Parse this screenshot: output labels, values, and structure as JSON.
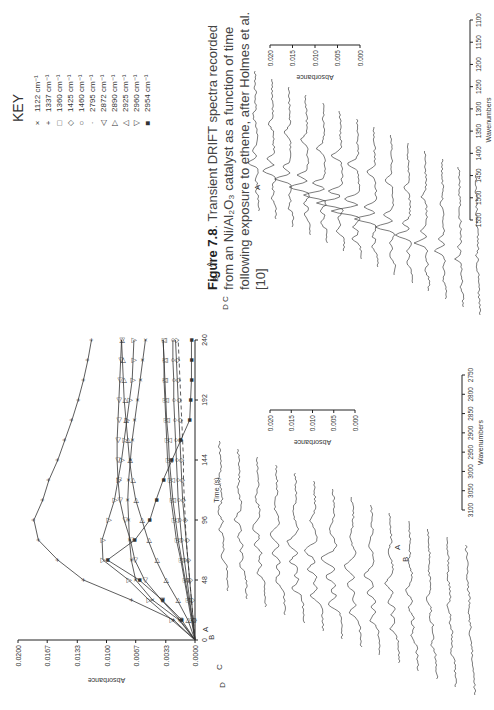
{
  "caption": {
    "figure_label": "Figure 7.8",
    "text": ". Transient DRIFT spectra recorded from an Ni/Al₂O₃ catalyst as a function of time following exposure to ethene, after Holmes et al. [10]"
  },
  "key": {
    "title": "KEY",
    "items": [
      {
        "symbol": "×",
        "label": "1122 cm⁻¹"
      },
      {
        "symbol": "+",
        "label": "1337 cm⁻¹"
      },
      {
        "symbol": "□",
        "label": "1360 cm⁻¹"
      },
      {
        "symbol": "◇",
        "label": "1425 cm⁻¹"
      },
      {
        "symbol": "○",
        "label": "1460 cm⁻¹"
      },
      {
        "symbol": "·",
        "label": "2795 cm⁻¹"
      },
      {
        "symbol": "◁",
        "label": "2872 cm⁻¹"
      },
      {
        "symbol": "▷",
        "label": "2890 cm⁻¹"
      },
      {
        "symbol": "△",
        "label": "2925 cm⁻¹"
      },
      {
        "symbol": "▽",
        "label": "2960 cm⁻¹"
      },
      {
        "symbol": "■",
        "label": "2954 cm⁻¹"
      }
    ]
  },
  "chart_data": [
    {
      "type": "line",
      "title": "",
      "xlabel": "Time (s)",
      "ylabel": "Absorbance",
      "x": [
        0,
        16,
        32,
        48,
        64,
        80,
        96,
        112,
        128,
        144,
        160,
        176,
        192,
        208,
        224,
        240
      ],
      "xticks": [
        0,
        48,
        96,
        144,
        192,
        240
      ],
      "yticks": [
        0.0,
        0.0033,
        0.0067,
        0.01,
        0.0133,
        0.0167,
        0.02
      ],
      "ytick_labels": [
        "0.0000",
        "0.0033",
        "0.0067",
        "0.0100",
        "0.0133",
        "0.0167",
        "0.0200"
      ],
      "ylim": [
        0,
        0.02
      ],
      "xlim": [
        0,
        240
      ],
      "series": [
        {
          "name": "1337 cm-1",
          "marker": "+",
          "values": [
            0,
            0.0024,
            0.0072,
            0.0126,
            0.0155,
            0.0177,
            0.0182,
            0.0172,
            0.0165,
            0.0155,
            0.0147,
            0.0139,
            0.0132,
            0.0126,
            0.0121,
            0.0117
          ]
        },
        {
          "name": "2960 cm-1",
          "marker": "▽",
          "values": [
            0,
            0.0026,
            0.0052,
            0.0075,
            0.0104,
            0.0105,
            0.0098,
            0.0091,
            0.0087,
            0.0083,
            0.008,
            0.0077,
            0.0074,
            0.0071,
            0.007,
            0.0069
          ]
        },
        {
          "name": "2954 cm-1",
          "marker": "■",
          "values": [
            0,
            0.0015,
            0.0037,
            0.0063,
            0.0099,
            0.0068,
            0.0051,
            0.0044,
            0.0036,
            0.0026,
            0.0016,
            0.0006,
            0.0005,
            0.0004,
            0.0004,
            0.0004
          ]
        },
        {
          "name": "1122 cm-1",
          "marker": "×",
          "values": [
            0,
            0.0018,
            0.0048,
            0.0067,
            0.0072,
            0.0074,
            0.0075,
            0.0076,
            0.0075,
            0.0073,
            0.0071,
            0.0068,
            0.0065,
            0.0062,
            0.0059,
            0.0056
          ]
        },
        {
          "name": "2872 cm-1",
          "marker": "◁",
          "values": [
            0,
            0.0017,
            0.0038,
            0.0057,
            0.0068,
            0.0073,
            0.008,
            0.0085,
            0.0087,
            0.0088,
            0.0088,
            0.0087,
            0.0086,
            0.0085,
            0.0084,
            0.0083
          ]
        },
        {
          "name": "2890 cm-1",
          "marker": "▷",
          "values": [
            0,
            0.0008,
            0.002,
            0.0033,
            0.0044,
            0.0053,
            0.006,
            0.0067,
            0.0071,
            0.0074,
            0.0076,
            0.0078,
            0.008,
            0.0081,
            0.0082,
            0.0083
          ]
        },
        {
          "name": "1360 cm-1",
          "marker": "□",
          "values": [
            0,
            0.0004,
            0.0008,
            0.0012,
            0.0016,
            0.0021,
            0.0024,
            0.0027,
            0.0029,
            0.0031,
            0.0032,
            0.0033,
            0.0034,
            0.0035,
            0.0035,
            0.0036
          ]
        },
        {
          "name": "2925 cm-1",
          "marker": "△",
          "values": [
            0,
            0.0003,
            0.0007,
            0.0011,
            0.0015,
            0.0019,
            0.0022,
            0.0025,
            0.0027,
            0.0029,
            0.003,
            0.0032,
            0.0033,
            0.0034,
            0.0035,
            0.0036
          ]
        },
        {
          "name": "1460 cm-1",
          "marker": "○",
          "values": [
            0,
            0.0003,
            0.0006,
            0.0009,
            0.0012,
            0.0015,
            0.0017,
            0.0019,
            0.002,
            0.0021,
            0.0022,
            0.0023,
            0.0024,
            0.0024,
            0.0025,
            0.0025
          ]
        },
        {
          "name": "1425 cm-1",
          "marker": "◇",
          "values": [
            0,
            0.0002,
            0.0004,
            0.0006,
            0.0008,
            0.001,
            0.0012,
            0.0014,
            0.0015,
            0.0016,
            0.0017,
            0.0018,
            0.0019,
            0.002,
            0.0021,
            0.0022
          ]
        },
        {
          "name": "2795 cm-1",
          "marker": "·",
          "values": [
            0,
            0.0002,
            0.0004,
            0.0006,
            0.0008,
            0.001,
            0.0011,
            0.0012,
            0.0013,
            0.0013,
            0.0014,
            0.0015,
            0.0016,
            0.0017,
            0.0018,
            0.0019
          ]
        }
      ]
    },
    {
      "type": "line",
      "title": "",
      "xlabel": "Wavenumbers",
      "ylabel": "Absorbance",
      "xticks": [
        3100,
        3050,
        3000,
        2950,
        2900,
        2850,
        2800,
        2750
      ],
      "yticks": [
        0.0,
        0.005,
        0.01,
        0.015,
        0.02
      ],
      "ytick_labels": [
        "0.000",
        "0.005",
        "0.010",
        "0.015",
        "0.020"
      ],
      "xlim": [
        3100,
        2750
      ],
      "annotations": [
        "A",
        "B",
        "C",
        "D",
        "A",
        "B"
      ],
      "description": "Stacked (waterfall) DRIFT spectra, C-H stretching region"
    },
    {
      "type": "line",
      "title": "",
      "xlabel": "Wavenumbers",
      "ylabel": "Absorbance",
      "xticks": [
        1550,
        1500,
        1450,
        1400,
        1350,
        1300,
        1250,
        1200,
        1150,
        1100
      ],
      "yticks": [
        0.0,
        0.005,
        0.01,
        0.015,
        0.02
      ],
      "ytick_labels": [
        "0.000",
        "0.005",
        "0.010",
        "0.015",
        "0.020"
      ],
      "xlim": [
        1550,
        1100
      ],
      "annotations": [
        "A",
        "B",
        "C",
        "D",
        "A"
      ],
      "description": "Stacked (waterfall) DRIFT spectra, fingerprint region"
    }
  ]
}
